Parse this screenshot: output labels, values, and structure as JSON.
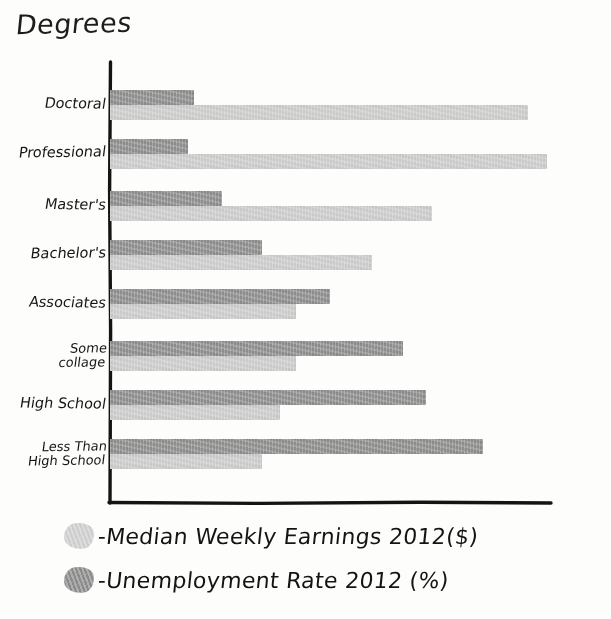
{
  "title": "Degrees",
  "legend": [
    {
      "marker": "light-gray-blob-swatch",
      "label": "-Median Weekly Earnings 2012($)"
    },
    {
      "marker": "dark-gray-blob-swatch",
      "label": "-Unemployment Rate 2012 (%)"
    }
  ],
  "colors": {
    "earnings_bar": "#cbcbcb",
    "unemployment_bar": "#8e8e8e",
    "axis": "#141414",
    "ink": "#161616",
    "paper": "#fdfdfc"
  },
  "chart_data": {
    "type": "bar",
    "orientation": "horizontal",
    "title": "Degrees",
    "xlabel": "",
    "ylabel": "Degrees",
    "grid": false,
    "legend_position": "below-axes",
    "axis_ticks_shown": false,
    "categories": [
      "Doctoral",
      "Professional",
      "Master's",
      "Bachelor's",
      "Associates",
      "Some\ncollage",
      "High School",
      "Less Than\nHigh School"
    ],
    "series": [
      {
        "name": "Median Weekly Earnings 2012($)",
        "color": "#cbcbcb",
        "unit": "$",
        "values": [
          1624,
          1735,
          1300,
          1066,
          785,
          727,
          652,
          471
        ],
        "bar_pixel_lengths": [
          418,
          437,
          322,
          262,
          186,
          186,
          170,
          152
        ]
      },
      {
        "name": "Unemployment Rate 2012 (%)",
        "color": "#8e8e8e",
        "unit": "%",
        "values": [
          2.5,
          2.1,
          3.5,
          4.5,
          6.2,
          7.7,
          8.3,
          12.4
        ],
        "bar_pixel_lengths": [
          84,
          78,
          112,
          152,
          220,
          293,
          316,
          373
        ]
      }
    ]
  }
}
